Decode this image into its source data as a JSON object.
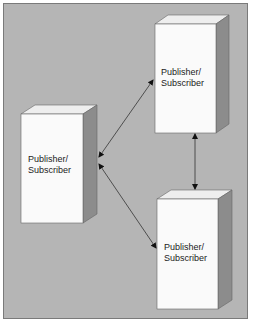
{
  "diagram": {
    "title": "",
    "background_color": "#b5b5b5",
    "nodes": [
      {
        "id": "left",
        "line1": "Publisher/",
        "line2": "Subscriber"
      },
      {
        "id": "top-right",
        "line1": "Publisher/",
        "line2": "Subscriber"
      },
      {
        "id": "bottom-right",
        "line1": "Publisher/",
        "line2": "Subscriber"
      }
    ],
    "edges": [
      {
        "from": "left",
        "to": "top-right",
        "direction": "bidirectional"
      },
      {
        "from": "left",
        "to": "bottom-right",
        "direction": "bidirectional"
      },
      {
        "from": "top-right",
        "to": "bottom-right",
        "direction": "bidirectional"
      }
    ],
    "colors": {
      "front": "#fafafa",
      "top": "#eeeeee",
      "side": "#8c8c8c",
      "line": "#333333"
    }
  }
}
